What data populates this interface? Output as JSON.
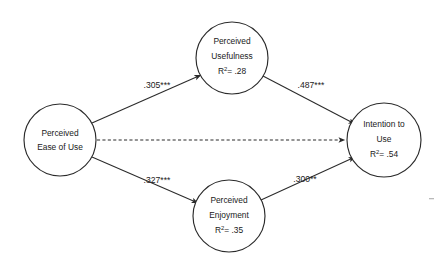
{
  "diagram": {
    "type": "path-model",
    "title": "",
    "background_color": "#ffffff",
    "line_color": "#2b2b2b",
    "text_color": "#1a1a1a",
    "nodes": [
      {
        "id": "peou",
        "name": "perceived-ease-of-use",
        "line1": "Perceived",
        "line2": "Ease of Use",
        "line3": "",
        "r_squared": "",
        "cx": 60,
        "cy": 140,
        "r": 36
      },
      {
        "id": "pu",
        "name": "perceived-usefulness",
        "line1": "Perceived",
        "line2": "Usefulness",
        "line3": "R",
        "r_squared": "= .28",
        "cx": 232,
        "cy": 58,
        "r": 36
      },
      {
        "id": "pe",
        "name": "perceived-enjoyment",
        "line1": "Perceived",
        "line2": "Enjoyment",
        "line3": "R",
        "r_squared": "= .35",
        "cx": 229,
        "cy": 216,
        "r": 36
      },
      {
        "id": "itu",
        "name": "intention-to-use",
        "line1": "Intention to",
        "line2": "Use",
        "line3": "R",
        "r_squared": "= .54",
        "cx": 384,
        "cy": 140,
        "r": 37
      }
    ],
    "paths": [
      {
        "id": "peou-pu",
        "name": "path-ease-of-use-to-usefulness",
        "from": "peou",
        "to": "pu",
        "style": "solid",
        "coefficient": ".305***",
        "label_x": 157,
        "label_y": 86
      },
      {
        "id": "pu-itu",
        "name": "path-usefulness-to-intention",
        "from": "pu",
        "to": "itu",
        "style": "solid",
        "coefficient": ".487***",
        "label_x": 311,
        "label_y": 86
      },
      {
        "id": "peou-pe",
        "name": "path-ease-of-use-to-enjoyment",
        "from": "peou",
        "to": "pe",
        "style": "solid",
        "coefficient": ".327***",
        "label_x": 157,
        "label_y": 181
      },
      {
        "id": "pe-itu",
        "name": "path-enjoyment-to-intention",
        "from": "pe",
        "to": "itu",
        "style": "solid",
        "coefficient": ".300**",
        "label_x": 305,
        "label_y": 180
      },
      {
        "id": "peou-itu",
        "name": "path-ease-of-use-to-intention-direct",
        "from": "peou",
        "to": "itu",
        "style": "dashed",
        "coefficient": "",
        "label_x": 0,
        "label_y": 0
      }
    ]
  }
}
